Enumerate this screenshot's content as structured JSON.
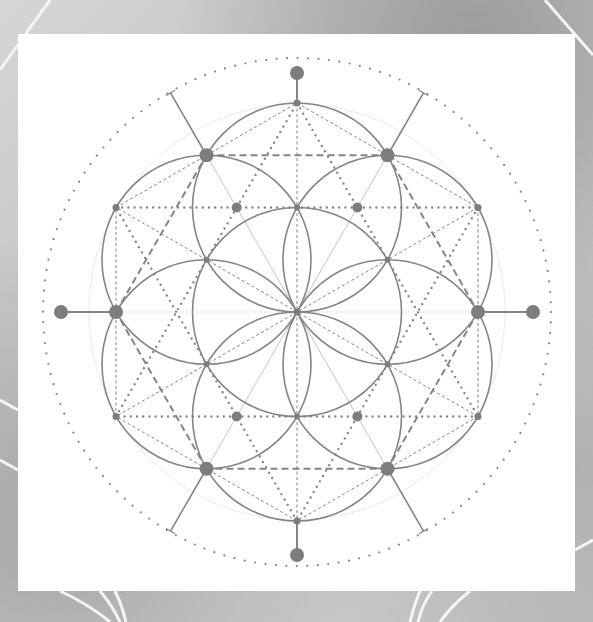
{
  "title": "Seed of Life sacred geometry illustration",
  "colors": {
    "card": "#ffffff",
    "stroke": "#858585",
    "stroke_light": "#c4c4c4",
    "node": "#7d7d7d",
    "streak": "#f4f4f4"
  },
  "geometry": {
    "center": [
      297,
      312
    ],
    "petal_radius": 104.5,
    "petal_circle_count": 7,
    "guide_circle_radius": 208,
    "outer_dotted_ring_radius": 254,
    "spoke_length": 253,
    "outer_node_distance": 240,
    "node_sizes": {
      "center": 3.5,
      "tip": 3.5,
      "hex": 7,
      "inner_star": 5,
      "outer": 7
    }
  },
  "elements": {
    "petal_circles": "7 overlapping circles (1 central, 6 around)",
    "tip_nodes": "6 small nodes at petal tips (2R)",
    "hexagon_nodes": "6 large nodes at petal intersections (sqrt3 R)",
    "star_nodes": "hexagram inner intersections",
    "outer_nodes": "4 outer nodes at N, S, E, W",
    "spokes": "4 diagonal spokes extending to outer ring",
    "dotted_hexagram": "bold dotted star through petal tips",
    "dashed_hexagon": "dashed hexagon through large nodes",
    "fine_dashed_lines": "fine dashed hexagon and diameters through tips",
    "outer_ring": "dotted outer circle"
  }
}
